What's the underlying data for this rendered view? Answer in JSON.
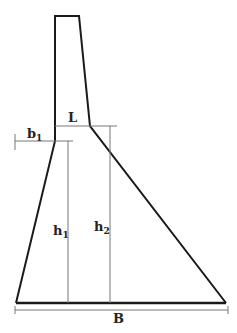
{
  "diagram": {
    "colors": {
      "outline": "#1a1a1a",
      "dimension": "#777777",
      "background": "#ffffff"
    },
    "labels": {
      "crest_width": "L",
      "toe_offset_main": "b",
      "toe_offset_sub": "1",
      "h1_main": "h",
      "h1_sub": "1",
      "h2_main": "h",
      "h2_sub": "2",
      "base_width": "B"
    }
  }
}
